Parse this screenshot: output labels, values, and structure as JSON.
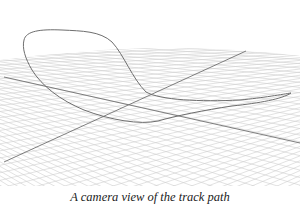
{
  "figure": {
    "caption": "A camera view of the track path",
    "colors": {
      "background": "#ffffff",
      "grid": "#c8c8c8",
      "axis": "#6a6a6a",
      "track": "#707070"
    },
    "scene": {
      "grid_plane": "perspective ground grid",
      "axes": [
        "axis-line-a",
        "axis-line-b"
      ],
      "track": "closed loop track path"
    }
  }
}
